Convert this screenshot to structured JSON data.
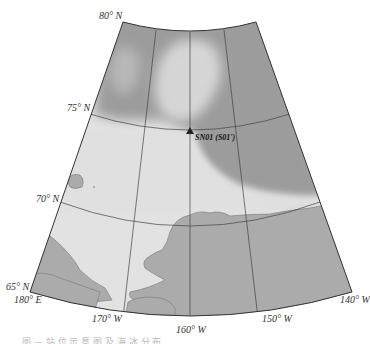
{
  "map": {
    "projection": "conic",
    "colors": {
      "dense_ice": "#9c9c9c",
      "light_ice": "#d8d8d8",
      "open_water": "#e2e2e2",
      "land": "#ababab",
      "grid": "#444444",
      "border": "#333333"
    },
    "latitude_labels": [
      "80° N",
      "75° N",
      "70° N",
      "65° N"
    ],
    "longitude_labels": [
      "180° E",
      "170° W",
      "160° W",
      "150° W",
      "140° W"
    ],
    "station": {
      "name": "SN01 (S01')",
      "marker": "triangle-icon"
    }
  },
  "caption": {
    "text": "图 — 站 位 示 意 图 及 海 冰 分 布"
  }
}
